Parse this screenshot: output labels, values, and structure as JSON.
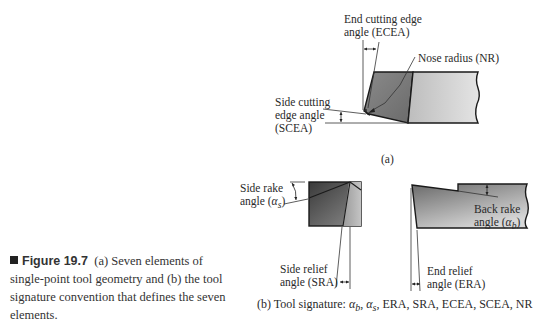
{
  "figure": {
    "number": "Figure 19.7",
    "caption": "(a) Seven elements of single-point tool geometry and (b) the tool signature convention that defines the seven elements.",
    "caption_lines": [
      "(a) Seven elements of",
      "single-point tool geometry and (b) the tool",
      "signature convention that defines the seven",
      "elements."
    ]
  },
  "part_a": {
    "label": "(a)",
    "ecea": {
      "line1": "End cutting edge",
      "line2": "angle (ECEA)"
    },
    "nose_radius": "Nose radius (NR)",
    "scea": {
      "line1": "Side cutting",
      "line2": "edge angle",
      "line3": "(SCEA)"
    }
  },
  "part_b": {
    "side_rake": {
      "line1": "Side rake",
      "line2_prefix": "angle (",
      "symbol": "α",
      "subscript": "s",
      "line2_suffix": ")"
    },
    "back_rake": {
      "line1": "Back rake",
      "line2_prefix": "angle (",
      "symbol": "α",
      "subscript": "b",
      "line2_suffix": ")"
    },
    "side_relief": {
      "line1": "Side relief",
      "line2": "angle (SRA)"
    },
    "end_relief": {
      "line1": "End relief",
      "line2": "angle (ERA)"
    },
    "signature": {
      "prefix": "(b) Tool signature: ",
      "a_b": "α",
      "sub_b": "b",
      "sep1": ", ",
      "a_s": "α",
      "sub_s": "s",
      "rest": ", ERA, SRA, ECEA, SCEA, NR"
    }
  },
  "colors": {
    "tool_dark": "#6e6e6e",
    "tool_light": "#c8c8c8",
    "outline": "#1a1a1a"
  }
}
